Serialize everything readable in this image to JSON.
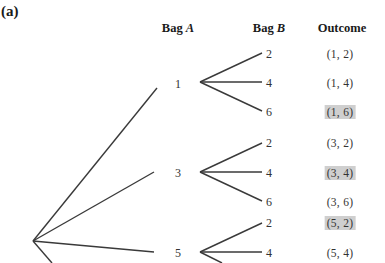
{
  "figure": {
    "part_label": "(a)",
    "headers": {
      "bag_a": {
        "prefix": "Bag ",
        "var": "A"
      },
      "bag_b": {
        "prefix": "Bag ",
        "var": "B"
      },
      "outcome": "Outcome"
    },
    "bag_a_nodes": [
      "1",
      "3",
      "5"
    ],
    "bag_b_nodes": [
      [
        "2",
        "4",
        "6"
      ],
      [
        "2",
        "4",
        "6"
      ],
      [
        "2",
        "4"
      ]
    ],
    "outcomes": [
      {
        "label": "(1, 2)",
        "highlighted": false
      },
      {
        "label": "(1, 4)",
        "highlighted": false
      },
      {
        "label": "(1, 6)",
        "highlighted": true
      },
      {
        "label": "(3, 2)",
        "highlighted": false
      },
      {
        "label": "(3, 4)",
        "highlighted": true
      },
      {
        "label": "(3, 6)",
        "highlighted": false
      },
      {
        "label": "(5, 2)",
        "highlighted": true
      },
      {
        "label": "(5, 4)",
        "highlighted": false
      }
    ],
    "highlight_color": "#cfcfcf",
    "line_color": "#3a3a3a"
  }
}
